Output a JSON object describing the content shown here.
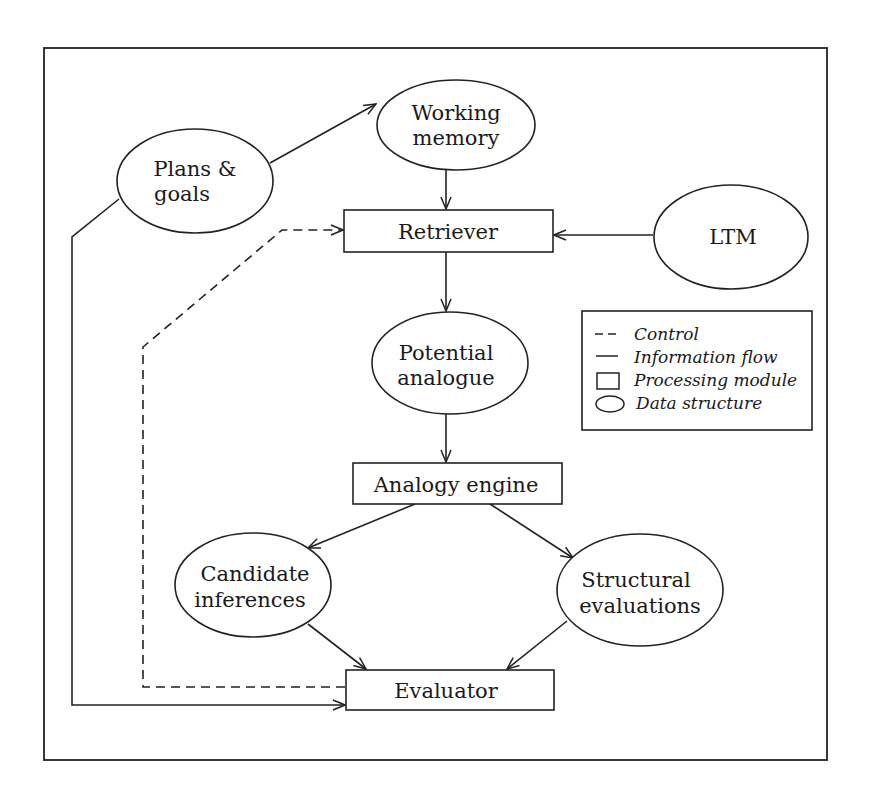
{
  "diagram": {
    "nodes": {
      "working_memory": {
        "type": "data-structure",
        "lines": [
          "Working",
          "memory"
        ]
      },
      "plans_goals": {
        "type": "data-structure",
        "lines": [
          "Plans &",
          "goals"
        ]
      },
      "retriever": {
        "type": "processing-module",
        "label": "Retriever"
      },
      "ltm": {
        "type": "data-structure",
        "label": "LTM"
      },
      "potential_analogue": {
        "type": "data-structure",
        "lines": [
          "Potential",
          "analogue"
        ]
      },
      "analogy_engine": {
        "type": "processing-module",
        "label": "Analogy engine"
      },
      "candidate_inferences": {
        "type": "data-structure",
        "lines": [
          "Candidate",
          "inferences"
        ]
      },
      "structural_evaluations": {
        "type": "data-structure",
        "lines": [
          "Structural",
          "evaluations"
        ]
      },
      "evaluator": {
        "type": "processing-module",
        "label": "Evaluator"
      }
    },
    "edges": [
      {
        "from": "Plans & goals",
        "to": "Working memory",
        "style": "information-flow"
      },
      {
        "from": "Working memory",
        "to": "Retriever",
        "style": "information-flow"
      },
      {
        "from": "LTM",
        "to": "Retriever",
        "style": "information-flow"
      },
      {
        "from": "Retriever",
        "to": "Potential analogue",
        "style": "information-flow"
      },
      {
        "from": "Potential analogue",
        "to": "Analogy engine",
        "style": "information-flow"
      },
      {
        "from": "Analogy engine",
        "to": "Candidate inferences",
        "style": "information-flow"
      },
      {
        "from": "Analogy engine",
        "to": "Structural evaluations",
        "style": "information-flow"
      },
      {
        "from": "Candidate inferences",
        "to": "Evaluator",
        "style": "information-flow"
      },
      {
        "from": "Structural evaluations",
        "to": "Evaluator",
        "style": "information-flow"
      },
      {
        "from": "Plans & goals",
        "to": "Evaluator",
        "style": "information-flow"
      },
      {
        "from": "Evaluator",
        "to": "Retriever",
        "style": "control"
      }
    ],
    "legend": {
      "items": [
        {
          "symbol": "dashed-line",
          "label": "Control"
        },
        {
          "symbol": "solid-line",
          "label": "Information flow"
        },
        {
          "symbol": "rectangle",
          "label": "Processing module"
        },
        {
          "symbol": "ellipse",
          "label": "Data structure"
        }
      ]
    }
  }
}
